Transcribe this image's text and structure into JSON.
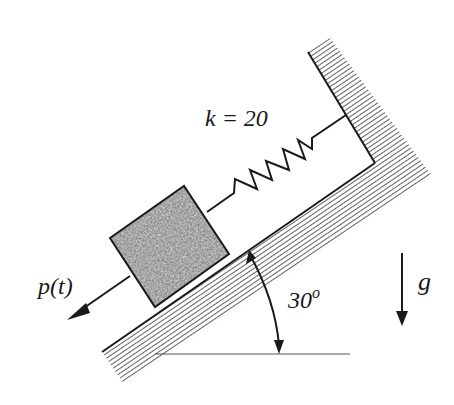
{
  "diagram": {
    "spring": {
      "label": "k = 20"
    },
    "force": {
      "label": "p(t)"
    },
    "angle": {
      "value": "30",
      "unit": "o"
    },
    "gravity": {
      "label": "g"
    }
  },
  "colors": {
    "ink": "#1a1a1a",
    "block_fill": "#8c8c8c",
    "hatch": "#3a3a3a",
    "background": "#ffffff"
  }
}
